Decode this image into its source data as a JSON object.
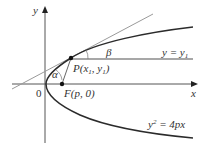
{
  "diagram": {
    "axes": {
      "x_label": "x",
      "y_label": "y",
      "origin_label": "0"
    },
    "point_p": {
      "label": "P(x",
      "sub1": "1",
      "mid": ", y",
      "sub2": "1",
      "end": ")"
    },
    "focus": {
      "label": "F(p, 0)"
    },
    "horizontal_line": {
      "label_left": "y = y",
      "label_sub": "1"
    },
    "angles": {
      "alpha": "α",
      "beta": "β"
    },
    "curve": {
      "label_base": "y",
      "label_sup": "2",
      "label_rest": " = 4px"
    },
    "colors": {
      "curve": "#2b2b2b",
      "axis": "#555555",
      "tangent": "#9a9a9a",
      "line": "#8a8a8a"
    }
  }
}
